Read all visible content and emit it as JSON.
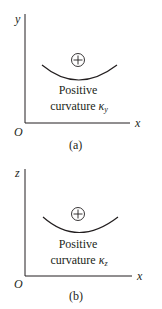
{
  "colors": {
    "ink": "#231f20",
    "background": "#ffffff"
  },
  "panels": [
    {
      "id": "a",
      "vertical_axis_label": "y",
      "horizontal_axis_label": "x",
      "origin_label": "O",
      "sign_symbol": "+",
      "sign_icon": "circle-plus-icon",
      "text_line1": "Positive",
      "text_line2": "curvature",
      "kappa": "κ",
      "kappa_subscript": "y",
      "caption": "(a)"
    },
    {
      "id": "b",
      "vertical_axis_label": "z",
      "horizontal_axis_label": "x",
      "origin_label": "O",
      "sign_symbol": "+",
      "sign_icon": "circle-plus-icon",
      "text_line1": "Positive",
      "text_line2": "curvature",
      "kappa": "κ",
      "kappa_subscript": "z",
      "caption": "(b)"
    }
  ]
}
